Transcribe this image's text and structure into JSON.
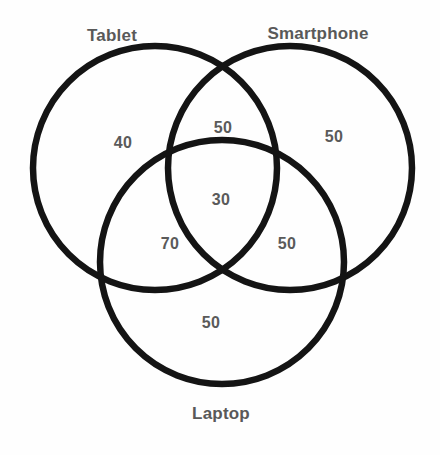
{
  "diagram": {
    "type": "venn",
    "set_count": 3,
    "background_color": "#fefefe",
    "stroke_color": "#141414",
    "text_color": "#5a5a5a",
    "sets": [
      {
        "key": "tablet",
        "label": "Tablet",
        "label_x": 112,
        "label_y": 36,
        "cx": 155,
        "cy": 168,
        "r": 122
      },
      {
        "key": "smartphone",
        "label": "Smartphone",
        "label_x": 318,
        "label_y": 34,
        "cx": 290,
        "cy": 168,
        "r": 122
      },
      {
        "key": "laptop",
        "label": "Laptop",
        "label_x": 221,
        "label_y": 414,
        "cx": 222,
        "cy": 262,
        "r": 122
      }
    ],
    "regions": [
      {
        "key": "tablet-only",
        "value": "40",
        "x": 123,
        "y": 143
      },
      {
        "key": "tablet-smartphone",
        "value": "50",
        "x": 223,
        "y": 128
      },
      {
        "key": "smartphone-only",
        "value": "50",
        "x": 334,
        "y": 137
      },
      {
        "key": "all-three",
        "value": "30",
        "x": 221,
        "y": 200
      },
      {
        "key": "tablet-laptop",
        "value": "70",
        "x": 170,
        "y": 244
      },
      {
        "key": "smartphone-laptop",
        "value": "50",
        "x": 287,
        "y": 244
      },
      {
        "key": "laptop-only",
        "value": "50",
        "x": 211,
        "y": 323
      }
    ]
  }
}
